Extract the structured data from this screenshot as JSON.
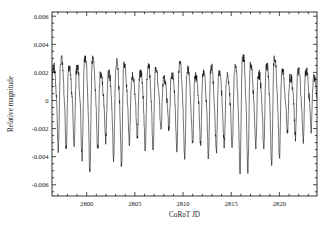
{
  "figure": {
    "background_color": "#ffffff",
    "curve_color": "#000000",
    "axis_color": "#000000"
  },
  "axes": {
    "x_title": "CoRoT JD",
    "y_title": "Relative magnitude",
    "x_ticklabels": [
      "2800",
      "2805",
      "2810",
      "2815",
      "2820"
    ],
    "y_ticklabels": [
      "0.006",
      "0.004",
      "0.002",
      "0",
      "-0.002",
      "-0.004",
      "-0.006"
    ]
  },
  "chart_data": {
    "type": "line",
    "title": "",
    "subtitle": "",
    "xlabel": "CoRoT JD",
    "ylabel": "Relative magnitude",
    "xlim": [
      2796.4,
      2823.9
    ],
    "ylim": [
      -0.0068,
      0.0063
    ],
    "grid": false,
    "legend": null,
    "annotations": [],
    "x_major_ticks": [
      2800,
      2805,
      2810,
      2815,
      2820
    ],
    "y_major_ticks": [
      0.006,
      0.004,
      0.002,
      0,
      -0.002,
      -0.004,
      -0.006
    ],
    "x_minor_tick_step": 1,
    "y_minor_tick_step": 0.0005,
    "series": [
      {
        "name": "relative magnitude",
        "n_points": 1180,
        "dominant_period_days": 0.82,
        "secondary_period_days": 3.2,
        "noise_amplitude": 0.00035,
        "envelope_x": [
          2796.4,
          2797.6,
          2798.6,
          2799.6,
          2800.4,
          2801.4,
          2802.4,
          2803.4,
          2804.4,
          2805.4,
          2806.4,
          2807.4,
          2808.4,
          2809.4,
          2810.4,
          2811.4,
          2812.4,
          2813.4,
          2814.5,
          2815.5,
          2816.5,
          2817.5,
          2818.5,
          2819.5,
          2820.5,
          2821.5,
          2822.5,
          2823.9
        ],
        "envelope_y": [
          0.0033,
          0.005,
          0.0058,
          0.0052,
          0.0056,
          0.0047,
          0.0047,
          0.005,
          0.0046,
          0.0044,
          0.0042,
          0.0038,
          0.0036,
          0.0042,
          0.0047,
          0.005,
          0.0046,
          0.004,
          0.0052,
          0.0054,
          0.0056,
          0.0057,
          0.0048,
          0.005,
          0.0046,
          0.004,
          0.0033,
          0.003
        ],
        "offset_x": [
          2796.4,
          2799.0,
          2802.0,
          2805.0,
          2808.0,
          2811.0,
          2814.0,
          2817.0,
          2820.0,
          2823.9
        ],
        "offset_y": [
          0.0005,
          0.0002,
          0.0,
          0.0001,
          0.0002,
          0.0,
          -0.0001,
          0.0,
          0.0001,
          0.0004
        ]
      }
    ]
  },
  "geometry": {
    "plot_left": 52,
    "plot_right": 317,
    "plot_top": 12,
    "plot_bottom": 196
  }
}
